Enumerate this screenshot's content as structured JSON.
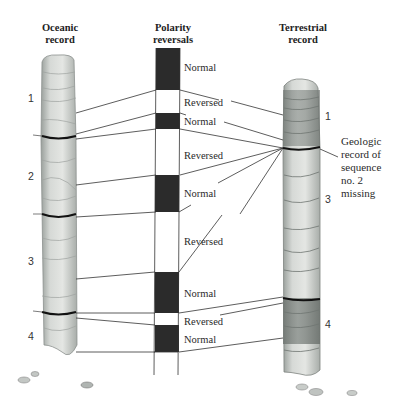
{
  "headings": {
    "oceanic": [
      "Oceanic",
      "record"
    ],
    "polarity": [
      "Polarity",
      "reversals"
    ],
    "terrestrial": [
      "Terrestrial",
      "record"
    ]
  },
  "polarity_bands": [
    {
      "label": "Normal",
      "type": "normal",
      "y_top": 48,
      "y_bottom": 90
    },
    {
      "label": "Reversed",
      "type": "reversed",
      "y_top": 90,
      "y_bottom": 113
    },
    {
      "label": "Normal",
      "type": "normal",
      "y_top": 113,
      "y_bottom": 129
    },
    {
      "label": "Reversed",
      "type": "reversed",
      "y_top": 129,
      "y_bottom": 175
    },
    {
      "label": "Normal",
      "type": "normal",
      "y_top": 175,
      "y_bottom": 212
    },
    {
      "label": "Reversed",
      "type": "reversed",
      "y_top": 212,
      "y_bottom": 272
    },
    {
      "label": "Normal",
      "type": "normal",
      "y_top": 272,
      "y_bottom": 313
    },
    {
      "label": "Reversed",
      "type": "reversed",
      "y_top": 313,
      "y_bottom": 325
    },
    {
      "label": "Normal",
      "type": "normal",
      "y_top": 325,
      "y_bottom": 352
    }
  ],
  "oceanic_sequences": [
    "1",
    "2",
    "3",
    "4"
  ],
  "terrestrial_sequences": [
    "1",
    "3",
    "4"
  ],
  "annotation": [
    "Geologic",
    "record of",
    "sequence",
    "no. 2",
    "missing"
  ],
  "colors": {
    "normal_band": "#2b2b2b",
    "reversed_band": "#ffffff",
    "line": "#333333",
    "core_light": "#d9dcd9",
    "core_mid": "#b9bdb9",
    "core_dark": "#7f8582",
    "boundary": "#111111"
  }
}
